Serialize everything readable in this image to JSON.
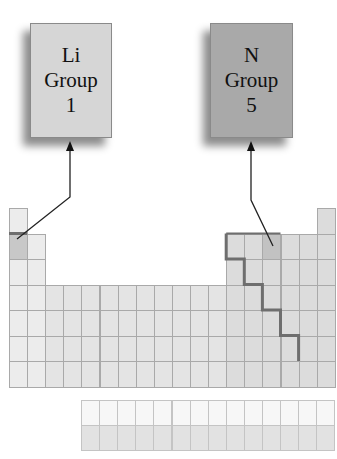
{
  "callouts": [
    {
      "id": "li",
      "symbol": "Li",
      "group_label": "Group",
      "group_number": "1",
      "fill": "#d6d6d6",
      "box": {
        "x": 30,
        "y": 23,
        "w": 82,
        "h": 115
      },
      "arrow_tip": {
        "x": 70,
        "y": 146
      },
      "line_points": [
        [
          70,
          146
        ],
        [
          70,
          197
        ],
        [
          17,
          239
        ]
      ]
    },
    {
      "id": "n",
      "symbol": "N",
      "group_label": "Group",
      "group_number": "5",
      "fill": "#a9a9a9",
      "box": {
        "x": 210,
        "y": 23,
        "w": 83,
        "h": 115
      },
      "arrow_tip": {
        "x": 251,
        "y": 146
      },
      "line_points": [
        [
          251,
          146
        ],
        [
          251,
          200
        ],
        [
          273,
          246
        ]
      ]
    }
  ],
  "periodic_table": {
    "origin": {
      "x": 9,
      "y": 208
    },
    "cell_w": 18.1,
    "cell_h": 25.5,
    "colors": {
      "s_block": "#ececec",
      "d_block": "#e4e4e4",
      "p_block": "#dcdcdc",
      "highlight_li": "#c8c8c8",
      "highlight_n": "#c2c2c2",
      "f_top": "#f7f7f7",
      "f_bottom": "#e2e2e2",
      "border": "#a9a9a9",
      "staircase": "#6e6e6e"
    },
    "f_block": {
      "x": 81,
      "y": 400,
      "cell_w": 18.1,
      "row_h": 25,
      "count": 14
    }
  }
}
